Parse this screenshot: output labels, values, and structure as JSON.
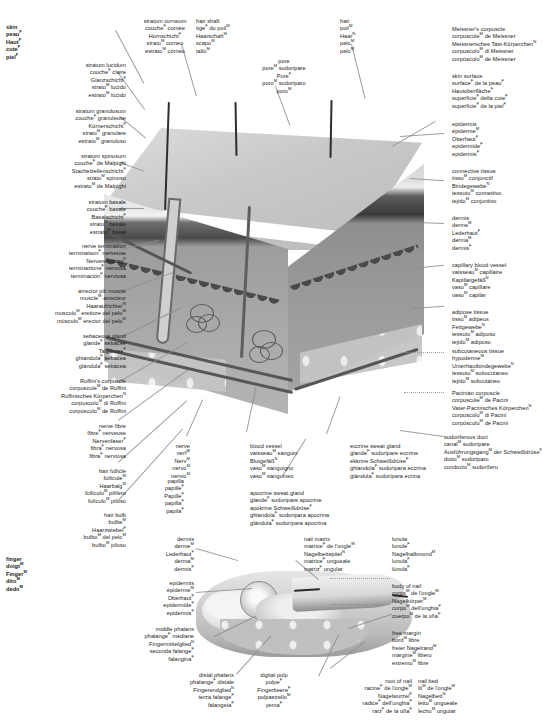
{
  "meta": {
    "plate_title": "Skin — anatomical plate (5 languages: English, French, German, Italian, Spanish)",
    "width": 544,
    "height": 721,
    "line_color": "#8d8d8d",
    "text_color": "#1a1a1a",
    "background": "#ffffff"
  },
  "terms": {
    "skin": [
      "skin",
      "peau<sup>F</sup>",
      "Haut<sup>F</sup>",
      "cute<sup>F</sup>",
      "piel<sup>F</sup>"
    ],
    "stratum_corneum": [
      "stratum corneum",
      "couche<sup>F</sup> cornée",
      "Hornschicht<sup>F</sup>",
      "strato<sup>M</sup> corneo",
      "estrato<sup>M</sup> córneo"
    ],
    "stratum_lucidum": [
      "stratum lucidum",
      "couche<sup>F</sup> claire",
      "Glanzschicht<sup>F</sup>",
      "strato<sup>M</sup> lucido",
      "estrato<sup>M</sup> lúcido"
    ],
    "stratum_granulosum": [
      "stratum granulosum",
      "couche<sup>F</sup> granuleuse",
      "Körnerschicht<sup>F</sup>",
      "strato<sup>M</sup> granulare",
      "estrato<sup>M</sup> granuloso"
    ],
    "stratum_spinosum": [
      "stratum spinosum",
      "couche<sup>F</sup> de Malpighi",
      "Stachelzellenschicht<sup>F</sup>",
      "strato<sup>M</sup> spinoso",
      "estrato<sup>M</sup> de Malpighi"
    ],
    "stratum_basale": [
      "stratum basale",
      "couche<sup>F</sup> basale",
      "Basalschicht<sup>F</sup>",
      "strato<sup>M</sup> basale",
      "estrato<sup>M</sup> basal"
    ],
    "nerve_termination": [
      "nerve termination",
      "terminaison<sup>F</sup> nerveuse",
      "Nervenendung<sup>F</sup>",
      "terminazione<sup>F</sup> nervosa",
      "terminación<sup>F</sup> nerviosa"
    ],
    "arrector_pili": [
      "arrector pili muscle",
      "muscle<sup>M</sup> arrecteur",
      "Haaraufrichter<sup>M</sup>",
      "muscolo<sup>M</sup> erettore del pelo<sup>M</sup>",
      "músculo<sup>M</sup> erector del pelo<sup>M</sup>"
    ],
    "sebaceous_gland": [
      "sebaceous gland",
      "glande<sup>F</sup> sébacée",
      "Talgdrüse<sup>F</sup>",
      "ghiandola<sup>F</sup> sebacea",
      "glándula<sup>F</sup> sebácea"
    ],
    "ruffini": [
      "Ruffini's corpuscle",
      "corpuscule<sup>M</sup> de Ruffini",
      "Ruffinisches Körperchen<sup>N</sup>",
      "corpuscolo<sup>M</sup> di Ruffini",
      "corpúsculo<sup>M</sup> de Ruffini"
    ],
    "nerve_fibre": [
      "nerve fibre",
      "fibre<sup>F</sup> nerveuse",
      "Nervenfaser<sup>F</sup>",
      "fibra<sup>F</sup> nervosa",
      "fibra<sup>F</sup> nerviosa"
    ],
    "hair_follicle": [
      "hair follicle",
      "follicule<sup>M</sup>",
      "Haarbalg<sup>M</sup>",
      "follicolo<sup>M</sup> pilifero",
      "folículo<sup>M</sup> piloso"
    ],
    "hair_bulb": [
      "hair bulb",
      "bulbe<sup>M</sup>",
      "Haarzwiebel<sup>F</sup>",
      "bulbo<sup>M</sup> del pelo<sup>M</sup>",
      "bulbo<sup>M</sup> piloso"
    ],
    "hair_shaft": [
      "hair shaft",
      "tige<sup>F</sup> du poil<sup>M</sup>",
      "Haarschaft<sup>M</sup>",
      "scapo<sup>M</sup>",
      "tallo<sup>M</sup>"
    ],
    "pore": [
      "pore",
      "pore<sup>M</sup> sudoripare",
      "Pore<sup>F</sup>",
      "poro<sup>M</sup> sudoriparo",
      "poro<sup>M</sup>"
    ],
    "hair": [
      "hair",
      "poil<sup>M</sup>",
      "Haar<sup>N</sup>",
      "pelo<sup>M</sup>",
      "pelo<sup>M</sup>"
    ],
    "meissner": [
      "Meissner's corpuscle",
      "corpuscule<sup>M</sup> de Meissner",
      "Meissnersches Tast-Körperchen<sup>N</sup>",
      "corpuscolo<sup>M</sup> di Meissner",
      "corpúsculo<sup>M</sup> de Meissner"
    ],
    "skin_surface": [
      "skin surface",
      "surface<sup>F</sup> de la peau<sup>F</sup>",
      "Hautoberfläche<sup>F</sup>",
      "superficie<sup>F</sup> della cute<sup>F</sup>",
      "superficie<sup>F</sup> de la piel<sup>F</sup>"
    ],
    "epidermis": [
      "epidermis",
      "épiderme<sup>M</sup>",
      "Oberhaut<sup>F</sup>",
      "epidermide<sup>F</sup>",
      "epidermis<sup>F</sup>"
    ],
    "connective_tissue": [
      "connective tissue",
      "tissu<sup>M</sup> conjonctif",
      "Bindegewebe<sup>N</sup>",
      "tessuto<sup>M</sup> connettivo",
      "tejido<sup>M</sup> conjuntivo"
    ],
    "dermis": [
      "dermis",
      "derme<sup>M</sup>",
      "Lederhaut<sup>F</sup>",
      "derma<sup>M</sup>",
      "dermis<sup>F</sup>"
    ],
    "capillary": [
      "capillary blood vessel",
      "vaisseau<sup>M</sup> capillaire",
      "Kapillargefäß<sup>N</sup>",
      "vaso<sup>M</sup> capillare",
      "vaso<sup>M</sup> capilar"
    ],
    "adipose": [
      "adipose tissue",
      "tissu<sup>M</sup> adipeux",
      "Fettgewebe<sup>N</sup>",
      "tessuto<sup>M</sup> adiposo",
      "tejido<sup>M</sup> adiposo"
    ],
    "subcutaneous": [
      "subcutaneous tissue",
      "hypoderme<sup>M</sup>",
      "Unterhautbindegewebe<sup>N</sup>",
      "tessuto<sup>M</sup> sottocutaneo",
      "tejido<sup>M</sup> subcutáneo"
    ],
    "pacinian": [
      "Pacinian corpuscle",
      "corpuscule<sup>M</sup> de Pacini",
      "Vater-Pacinisches Körperchen<sup>N</sup>",
      "corpuscolo<sup>M</sup> di Pacini",
      "corpúsculo<sup>M</sup> de Pacini"
    ],
    "sudoriferous_duct": [
      "sudoriferous duct",
      "canal<sup>M</sup> sudoripare",
      "Ausführungsgang<sup>M</sup> der Schweißdrüse<sup>F</sup>",
      "dotto<sup>M</sup> sudoriparo",
      "conducto<sup>M</sup> sudoríferu"
    ],
    "papilla": [
      "papilla",
      "papille<sup>F</sup>",
      "Papille<sup>F</sup>",
      "papilla<sup>F</sup>",
      "papila<sup>F</sup>"
    ],
    "nerve": [
      "nerve",
      "nerf<sup>M</sup>",
      "Nerv<sup>M</sup>",
      "nervo<sup>M</sup>",
      "nervio<sup>M</sup>"
    ],
    "blood_vessel": [
      "blood vessel",
      "vaisseau<sup>M</sup> sanguin",
      "Blutgefäß<sup>N</sup>",
      "vaso<sup>M</sup> sanguigno",
      "vaso<sup>M</sup> sanguíneo"
    ],
    "apocrine": [
      "apocrine sweat gland",
      "glande<sup>F</sup> sudoripare apocrine",
      "apokrine Schweißdrüse<sup>F</sup>",
      "ghiandola<sup>F</sup> sudoripara apocrina",
      "glándula<sup>F</sup> sudorípara apocrina"
    ],
    "eccrine": [
      "eccrine sweat gland",
      "glande<sup>F</sup> sudoripare eccrine",
      "ekkrine Schweißdrüse<sup>F</sup>",
      "ghiandola<sup>F</sup> sudoripara eccrina",
      "glándula<sup>F</sup> sudorípara ecrina"
    ],
    "finger": [
      "finger",
      "doigt<sup>M</sup>",
      "Finger<sup>M</sup>",
      "dito<sup>M</sup>",
      "dedo<sup>M</sup>"
    ],
    "dermis2": [
      "dermis",
      "derme<sup>M</sup>",
      "Lederhaut<sup>F</sup>",
      "derma<sup>M</sup>",
      "dermis<sup>F</sup>"
    ],
    "epidermis2": [
      "epidermis",
      "épiderme<sup>M</sup>",
      "Oberhaut<sup>F</sup>",
      "epidermide<sup>F</sup>",
      "epidermis<sup>F</sup>"
    ],
    "middle_phalanx": [
      "middle phalanx",
      "phalange<sup>F</sup> médiane",
      "Fingermittelglied<sup>N</sup>",
      "seconda falange<sup>F</sup>",
      "falangina<sup>F</sup>"
    ],
    "distal_phalanx": [
      "distal phalanx",
      "phalange<sup>F</sup> distale",
      "Fingerendglied<sup>N</sup>",
      "terza falange<sup>F</sup>",
      "falangeta<sup>F</sup>"
    ],
    "digital_pulp": [
      "digital pulp",
      "pulpe<sup>F</sup>",
      "Fingerbeere<sup>F</sup>",
      "polpastrello<sup>M</sup>",
      "yema<sup>F</sup>"
    ],
    "nail_matrix": [
      "nail matrix",
      "matrice<sup>F</sup> de l'ongle<sup>M</sup>",
      "Nagelbettepitel<sup>N</sup>",
      "matrice<sup>F</sup> ungueale",
      "matriz<sup>F</sup> ungular"
    ],
    "lunula": [
      "lunula",
      "lunule<sup>F</sup>",
      "Nagelhalbmond<sup>M</sup>",
      "lunula<sup>F</sup>",
      "lúnula<sup>F</sup>"
    ],
    "body_of_nail": [
      "body of nail",
      "corps<sup>M</sup> de l'ongle<sup>M</sup>",
      "Nagelkörper<sup>M</sup>",
      "corpo<sup>M</sup> dell'unghia<sup>F</sup>",
      "cuerpo<sup>M</sup> de la uña<sup>F</sup>"
    ],
    "free_margin": [
      "free margin",
      "bord<sup>M</sup> libre",
      "freier Nagelrand<sup>M</sup>",
      "margine<sup>M</sup> libero",
      "extremo<sup>M</sup> libre"
    ],
    "root_of_nail": [
      "root of nail",
      "racine<sup>F</sup> de l'ongle<sup>M</sup>",
      "Nagelwurzel<sup>F</sup>",
      "radice<sup>F</sup> dell'unghia<sup>F</sup>",
      "raíz<sup>F</sup> de la uña<sup>F</sup>"
    ],
    "nail_bed": [
      "nail bed",
      "lit<sup>M</sup> de l'ongle<sup>M</sup>",
      "Nagelbett<sup>N</sup>",
      "letto<sup>M</sup> ungueale",
      "lecho<sup>M</sup> ungular"
    ]
  }
}
